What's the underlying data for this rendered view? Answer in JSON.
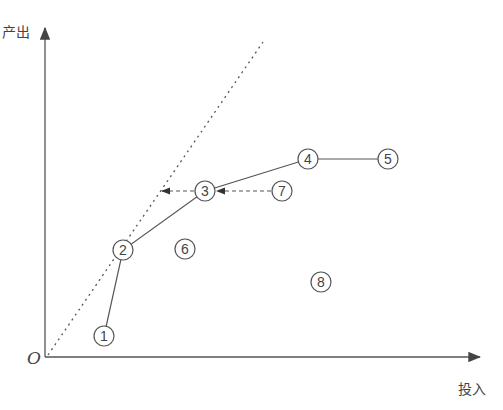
{
  "axes": {
    "y_label": "产出",
    "x_label": "投入",
    "origin_label": "O"
  },
  "colors": {
    "line": "#444444",
    "dotted": "#555555",
    "background": "#ffffff"
  },
  "points": [
    {
      "id": "1",
      "label": "1",
      "x": 104,
      "y": 336
    },
    {
      "id": "2",
      "label": "2",
      "x": 123,
      "y": 250
    },
    {
      "id": "3",
      "label": "3",
      "x": 205,
      "y": 191
    },
    {
      "id": "4",
      "label": "4",
      "x": 308,
      "y": 159
    },
    {
      "id": "5",
      "label": "5",
      "x": 388,
      "y": 159
    },
    {
      "id": "6",
      "label": "6",
      "x": 185,
      "y": 249
    },
    {
      "id": "7",
      "label": "7",
      "x": 282,
      "y": 191
    },
    {
      "id": "8",
      "label": "8",
      "x": 321,
      "y": 282
    }
  ],
  "frontier": [
    "1",
    "2",
    "3",
    "4",
    "5"
  ],
  "ray": {
    "from": [
      48,
      355
    ],
    "to": [
      263,
      42
    ],
    "style": "dotted"
  },
  "projections": [
    {
      "from": "7",
      "to": "3",
      "style": "dashed-arrow"
    },
    {
      "from": "3",
      "to_xy": [
        162,
        191
      ],
      "style": "dashed-arrow"
    }
  ]
}
